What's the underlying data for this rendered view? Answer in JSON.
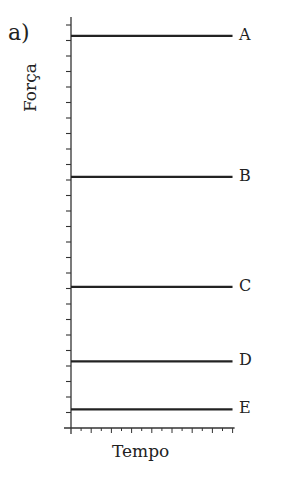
{
  "panel": {
    "label": "a)"
  },
  "chart_data": {
    "type": "line",
    "title": "",
    "xlabel": "Tempo",
    "ylabel": "Força",
    "grid": false,
    "legend": "inline labels at right end of each line",
    "x_ticks": 16,
    "y_ticks": 27,
    "xlim": [
      0,
      16
    ],
    "ylim": [
      0,
      27
    ],
    "tick_labels": {
      "x": [],
      "y": []
    },
    "series": [
      {
        "name": "A",
        "x": [
          0,
          15.2
        ],
        "values": [
          25.3,
          25.3
        ]
      },
      {
        "name": "B",
        "x": [
          0,
          15.2
        ],
        "values": [
          16.2,
          16.2
        ]
      },
      {
        "name": "C",
        "x": [
          0,
          15.2
        ],
        "values": [
          9.1,
          9.1
        ]
      },
      {
        "name": "D",
        "x": [
          0,
          15.2
        ],
        "values": [
          4.3,
          4.3
        ]
      },
      {
        "name": "E",
        "x": [
          0,
          15.2
        ],
        "values": [
          1.2,
          1.2
        ]
      }
    ],
    "annotations": [
      "a)"
    ]
  },
  "colors": {
    "line": "#222222",
    "axis": "#333333",
    "background": "#ffffff"
  }
}
